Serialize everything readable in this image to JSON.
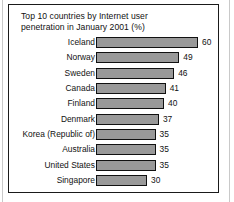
{
  "figure": {
    "title_line1": "Top 10 countries by Internet user",
    "title_line2": "penetration in January 2001 (%)",
    "title_full": "Top 10 countries by Internet user\npenetration in January 2001 (%)"
  },
  "colors": {
    "bar_fill": "#999999",
    "bar_stroke": "#111111",
    "frame": "#1a1a1a",
    "text": "#111111",
    "background": "#ffffff"
  },
  "chart_data": {
    "type": "bar",
    "orientation": "horizontal",
    "title": "Top 10 countries by Internet user penetration in January 2001 (%)",
    "xlabel": "",
    "ylabel": "",
    "xlim": [
      0,
      60
    ],
    "grid": false,
    "legend": false,
    "data_labels": true,
    "units": "%",
    "categories": [
      "Iceland",
      "Norway",
      "Sweden",
      "Canada",
      "Finland",
      "Denmark",
      "Korea (Republic of)",
      "Australia",
      "United States",
      "Singapore"
    ],
    "values": [
      60,
      49,
      46,
      41,
      40,
      37,
      35,
      35,
      35,
      30
    ],
    "rows": [
      {
        "label": "Iceland",
        "value": 60,
        "value_text": "60"
      },
      {
        "label": "Norway",
        "value": 49,
        "value_text": "49"
      },
      {
        "label": "Sweden",
        "value": 46,
        "value_text": "46"
      },
      {
        "label": "Canada",
        "value": 41,
        "value_text": "41"
      },
      {
        "label": "Finland",
        "value": 40,
        "value_text": "40"
      },
      {
        "label": "Denmark",
        "value": 37,
        "value_text": "37"
      },
      {
        "label": "Korea (Republic of)",
        "value": 35,
        "value_text": "35"
      },
      {
        "label": "Australia",
        "value": 35,
        "value_text": "35"
      },
      {
        "label": "United States",
        "value": 35,
        "value_text": "35"
      },
      {
        "label": "Singapore",
        "value": 30,
        "value_text": "30"
      }
    ]
  }
}
